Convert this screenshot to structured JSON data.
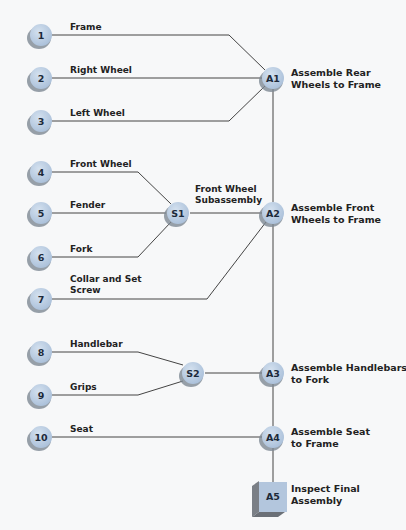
{
  "diagram": {
    "colors": {
      "node_fill": "#b9cce3",
      "node_shadow": "#7d8894",
      "line": "#444444"
    },
    "parts": [
      {
        "id": "1",
        "label": "Frame"
      },
      {
        "id": "2",
        "label": "Right Wheel"
      },
      {
        "id": "3",
        "label": "Left Wheel"
      },
      {
        "id": "4",
        "label": "Front Wheel"
      },
      {
        "id": "5",
        "label": "Fender"
      },
      {
        "id": "6",
        "label": "Fork"
      },
      {
        "id": "7",
        "label_lines": [
          "Collar and Set",
          "Screw"
        ]
      },
      {
        "id": "8",
        "label": "Handlebar"
      },
      {
        "id": "9",
        "label": "Grips"
      },
      {
        "id": "10",
        "label": "Seat"
      }
    ],
    "subassemblies": [
      {
        "id": "S1",
        "label_lines": [
          "Front Wheel",
          "Subassembly"
        ]
      },
      {
        "id": "S2"
      }
    ],
    "assemblies": [
      {
        "id": "A1",
        "desc_lines": [
          "Assemble Rear",
          "Wheels to Frame"
        ]
      },
      {
        "id": "A2",
        "desc_lines": [
          "Assemble Front",
          "Wheels to Frame"
        ]
      },
      {
        "id": "A3",
        "desc_lines": [
          "Assemble Handlebars",
          "to Fork"
        ]
      },
      {
        "id": "A4",
        "desc_lines": [
          "Assemble Seat",
          "to Frame"
        ]
      }
    ],
    "inspection": {
      "id": "A5",
      "desc_lines": [
        "Inspect Final",
        "Assembly"
      ]
    }
  }
}
